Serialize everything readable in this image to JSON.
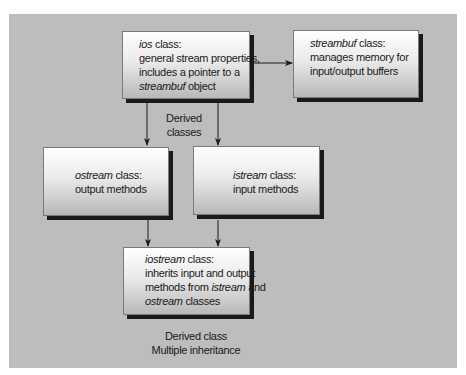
{
  "diagram": {
    "nodes": {
      "ios": {
        "name_italic": "ios",
        "name_suffix": " class:",
        "line2": "general stream properties,",
        "line3": "includes a pointer to a",
        "line4_italic": "streambuf",
        "line4_suffix": " object"
      },
      "streambuf": {
        "name_italic": "streambuf",
        "name_suffix": " class:",
        "line2": "manages memory for",
        "line3": "input/output buffers"
      },
      "ostream": {
        "name_italic": "ostream",
        "name_suffix": " class:",
        "line2": "output methods"
      },
      "istream": {
        "name_italic": "istream",
        "name_suffix": " class:",
        "line2": "input methods"
      },
      "iostream": {
        "name_italic": "iostream",
        "name_suffix": " class:",
        "line2": "inherits input and output",
        "line3_prefix": "methods from ",
        "line3_italic": "istream",
        "line3_suffix": " and",
        "line4_italic": "ostream",
        "line4_suffix": " classes"
      }
    },
    "labels": {
      "derived_classes_1": "Derived",
      "derived_classes_2": "classes",
      "bottom_1": "Derived class",
      "bottom_2": "Multiple inheritance"
    },
    "edges": [
      {
        "from": "ios",
        "to": "streambuf",
        "type": "arrow"
      },
      {
        "from": "ios",
        "to": "ostream",
        "type": "arrow"
      },
      {
        "from": "ios",
        "to": "istream",
        "type": "arrow"
      },
      {
        "from": "ostream",
        "to": "iostream",
        "type": "arrow"
      },
      {
        "from": "istream",
        "to": "iostream",
        "type": "arrow"
      }
    ],
    "colors": {
      "panel": "#bdbdbd",
      "shadow": "#1a1a1a",
      "line": "#1a1a1a"
    }
  }
}
